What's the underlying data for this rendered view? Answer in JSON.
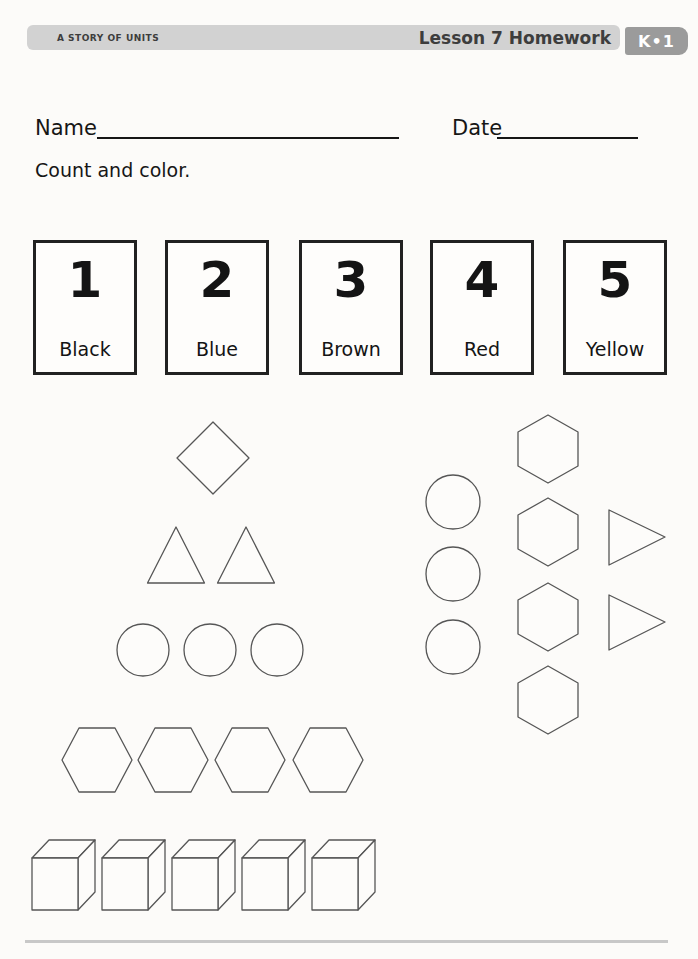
{
  "header": {
    "program_title": "A STORY OF UNITS",
    "lesson_title": "Lesson 7 Homework",
    "grade_badge": "K•1",
    "bar_color": "#d2d2d2",
    "badge_color": "#9b9b9b",
    "text_color": "#3d3d3d"
  },
  "form": {
    "name_label": "Name",
    "name_value": "",
    "date_label": "Date",
    "date_value": ""
  },
  "instruction": {
    "text": "Count and color."
  },
  "color_key_cards": [
    {
      "number": "1",
      "color_name": "Black"
    },
    {
      "number": "2",
      "color_name": "Blue"
    },
    {
      "number": "3",
      "color_name": "Brown"
    },
    {
      "number": "4",
      "color_name": "Red"
    },
    {
      "number": "5",
      "color_name": "Yellow"
    }
  ],
  "shapes": {
    "stroke_color": "#565656",
    "groups": [
      {
        "id": "diamonds",
        "type": "diamond",
        "count": 1
      },
      {
        "id": "triangles-up",
        "type": "triangle-up",
        "count": 2
      },
      {
        "id": "circles-row",
        "type": "circle",
        "count": 3
      },
      {
        "id": "hexagons-row",
        "type": "hexagon-flat",
        "count": 4
      },
      {
        "id": "cubes-row",
        "type": "cube",
        "count": 5
      },
      {
        "id": "circles-column",
        "type": "circle",
        "count": 3
      },
      {
        "id": "hexagons-column",
        "type": "hexagon-pointy",
        "count": 4
      },
      {
        "id": "triangles-right",
        "type": "triangle-right",
        "count": 2
      }
    ]
  },
  "footer": {
    "divider_color": "#c8c8c8"
  }
}
